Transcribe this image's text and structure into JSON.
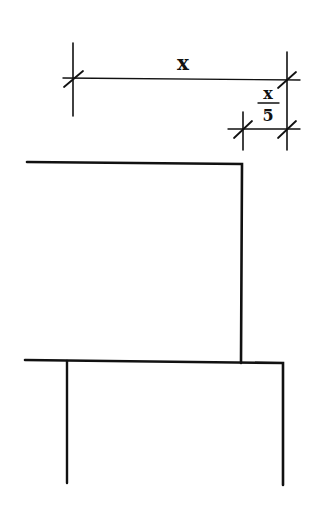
{
  "diagram": {
    "dimension_main": {
      "label": "x"
    },
    "dimension_offset": {
      "numerator": "x",
      "denominator": "5"
    },
    "colors": {
      "line": "#111111",
      "background": "#ffffff"
    }
  }
}
